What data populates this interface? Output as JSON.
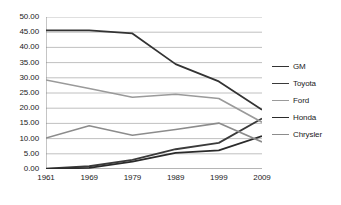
{
  "chart_data": {
    "type": "line",
    "title": "",
    "xlabel": "",
    "ylabel": "",
    "categories": [
      "1961",
      "1969",
      "1979",
      "1989",
      "1999",
      "2009"
    ],
    "x": [
      1961,
      1969,
      1979,
      1989,
      1999,
      2009
    ],
    "ylim": [
      0,
      50
    ],
    "ytick_step": 5,
    "grid": true,
    "legend_position": "right",
    "ytick_labels": [
      "0.00",
      "5.00",
      "10.00",
      "15.00",
      "20.00",
      "25.00",
      "30.00",
      "35.00",
      "40.00",
      "45.00",
      "50.00"
    ],
    "ytick_values": [
      0,
      5,
      10,
      15,
      20,
      25,
      30,
      35,
      40,
      45,
      50
    ],
    "series": [
      {
        "name": "GM",
        "color": "#333333",
        "width": 1.8,
        "values": [
          45.6,
          45.6,
          44.6,
          34.5,
          28.8,
          19.5
        ]
      },
      {
        "name": "Toyota",
        "color": "#3a3a3a",
        "width": 1.8,
        "values": [
          0.1,
          0.9,
          3.0,
          6.5,
          8.6,
          16.6
        ]
      },
      {
        "name": "Ford",
        "color": "#9a9a9a",
        "width": 1.6,
        "values": [
          29.3,
          26.5,
          23.6,
          24.6,
          23.2,
          15.4
        ]
      },
      {
        "name": "Honda",
        "color": "#2b2b2b",
        "width": 1.8,
        "values": [
          0.0,
          0.4,
          2.4,
          5.3,
          6.1,
          10.8
        ]
      },
      {
        "name": "Chrysler",
        "color": "#8c8c8c",
        "width": 1.6,
        "values": [
          10.2,
          14.2,
          11.1,
          13.0,
          15.1,
          8.9
        ]
      }
    ]
  },
  "legend": {
    "items": [
      {
        "label": "GM"
      },
      {
        "label": "Toyota"
      },
      {
        "label": "Ford"
      },
      {
        "label": "Honda"
      },
      {
        "label": "Chrysler"
      }
    ]
  },
  "style": {
    "grid_color": "#b0b0b0",
    "axis_color": "#808080",
    "text_color": "#1b1b1b",
    "background": "#ffffff"
  }
}
